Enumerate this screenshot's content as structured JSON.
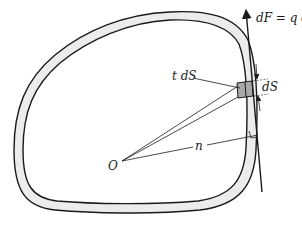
{
  "diagram": {
    "labels": {
      "force": "dF = q dS",
      "area_element": "t dS",
      "arc_length": "dS",
      "normal_distance": "n",
      "origin": "O"
    },
    "colors": {
      "stroke": "#1a1a1a",
      "wall_fill": "#ececec",
      "element_fill": "#a8a8a8",
      "background": "#ffffff"
    }
  }
}
